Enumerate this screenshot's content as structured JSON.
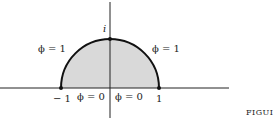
{
  "figure": {
    "labels": {
      "top_point": "i",
      "arc_left": "ϕ = 1",
      "arc_right": "ϕ = 1",
      "base_left": "ϕ = 0",
      "base_right": "ϕ = 0",
      "x_neg_one": "− 1",
      "x_one": "1"
    },
    "caption": "FIGUI",
    "colors": {
      "fill": "#d9d9d9",
      "stroke": "#111111"
    }
  }
}
